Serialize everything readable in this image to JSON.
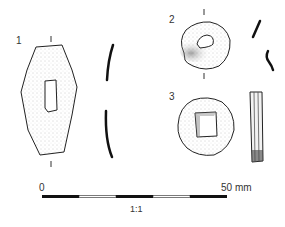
{
  "figure": {
    "objects": [
      {
        "label": "1",
        "shape": "elongated-hexagonal-plate",
        "hole": "rectangular"
      },
      {
        "label": "2",
        "shape": "oval-disc",
        "hole": "small-rounded"
      },
      {
        "label": "3",
        "shape": "round-disc",
        "hole": "square"
      }
    ],
    "scale_bar": {
      "start_label": "0",
      "end_label": "50 mm",
      "ratio_label": "1:1",
      "segments": 5
    },
    "colors": {
      "line": "#222222",
      "stipple": "#bdbdbd",
      "background": "#ffffff"
    }
  }
}
